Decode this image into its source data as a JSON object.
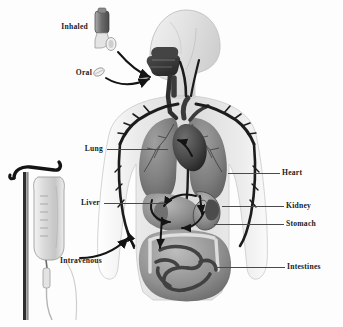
{
  "figure": {
    "style": "grayscale anatomical illustration",
    "background_color": "#fdfdfd",
    "label_color": "#1a1a1a",
    "leader_line_color": "#4a4a4a"
  },
  "routes": [
    {
      "id": "inhaled",
      "label": "Inhaled",
      "icon": "inhaler-icon",
      "label_x": 58,
      "label_y": 27,
      "side": "left"
    },
    {
      "id": "oral",
      "label": "Oral",
      "icon": "pill-icon",
      "label_x": 74,
      "label_y": 73,
      "side": "left"
    },
    {
      "id": "intravenous",
      "label": "Intravenous",
      "icon": "iv-bag-icon",
      "label_x": 60,
      "label_y": 261,
      "side": "right"
    }
  ],
  "organs": [
    {
      "id": "lung",
      "label": "Lung",
      "label_x": 103,
      "label_y": 149,
      "side": "left",
      "leader_x1": 107,
      "leader_x2": 168,
      "leader_y": 149
    },
    {
      "id": "liver",
      "label": "Liver",
      "label_x": 100,
      "label_y": 203,
      "side": "left",
      "leader_x1": 104,
      "leader_x2": 166,
      "leader_y": 203
    },
    {
      "id": "heart",
      "label": "Heart",
      "label_x": 282,
      "label_y": 173,
      "side": "right",
      "leader_x1": 228,
      "leader_x2": 280,
      "leader_y": 173
    },
    {
      "id": "kidney",
      "label": "Kidney",
      "label_x": 286,
      "label_y": 206,
      "side": "right",
      "leader_x1": 222,
      "leader_x2": 284,
      "leader_y": 206
    },
    {
      "id": "stomach",
      "label": "Stomach",
      "label_x": 286,
      "label_y": 224,
      "side": "right",
      "leader_x1": 214,
      "leader_x2": 284,
      "leader_y": 224
    },
    {
      "id": "intestines",
      "label": "Intestines",
      "label_x": 287,
      "label_y": 267,
      "side": "right",
      "leader_x1": 214,
      "leader_x2": 285,
      "leader_y": 267
    }
  ]
}
